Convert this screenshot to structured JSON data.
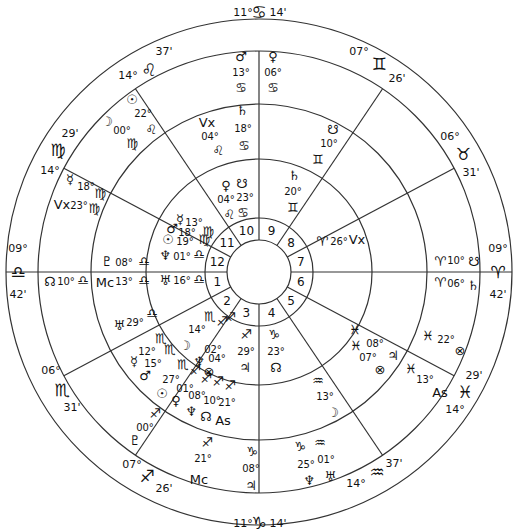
{
  "chart_title": "Bi-wheel natal chart (astrology)",
  "center": {
    "x": 259,
    "y": 272
  },
  "radii": {
    "outer": 253,
    "zodiac_inner": 221,
    "ring2": 168,
    "ring3": 113,
    "house_outer": 54,
    "inner": 32
  },
  "line_color": "#333333",
  "house_cusps": [
    {
      "id": "asc",
      "angle": 180,
      "degree": "09°",
      "sign_glyph": "♎",
      "minute": "42'",
      "sign": "Libra"
    },
    {
      "id": "c2",
      "angle": 208,
      "degree": "06°",
      "sign_glyph": "♏",
      "minute": "31'",
      "sign": "Scorpio"
    },
    {
      "id": "c3",
      "angle": 236,
      "degree": "07°",
      "sign_glyph": "♐",
      "minute": "26'",
      "sign": "Sagittarius"
    },
    {
      "id": "ic",
      "angle": 270,
      "degree": "11°",
      "sign_glyph": "♑",
      "minute": "14'",
      "sign": "Capricorn"
    },
    {
      "id": "c5",
      "angle": 304,
      "degree": "14°",
      "sign_glyph": "♒",
      "minute": "37'",
      "sign": "Aquarius"
    },
    {
      "id": "c6",
      "angle": 332,
      "degree": "14°",
      "sign_glyph": "♓",
      "minute": "29'",
      "sign": "Pisces"
    },
    {
      "id": "dsc",
      "angle": 0,
      "degree": "09°",
      "sign_glyph": "♈",
      "minute": "42'",
      "sign": "Aries"
    },
    {
      "id": "c8",
      "angle": 28,
      "degree": "06°",
      "sign_glyph": "♉",
      "minute": "31'",
      "sign": "Taurus"
    },
    {
      "id": "c9",
      "angle": 56,
      "degree": "07°",
      "sign_glyph": "♊",
      "minute": "26'",
      "sign": "Gemini"
    },
    {
      "id": "mc",
      "angle": 90,
      "degree": "11°",
      "sign_glyph": "♋",
      "minute": "14'",
      "sign": "Cancer"
    },
    {
      "id": "c11",
      "angle": 124,
      "degree": "14°",
      "sign_glyph": "♌",
      "minute": "37'",
      "sign": "Leo"
    },
    {
      "id": "c12",
      "angle": 152,
      "degree": "14°",
      "sign_glyph": "♍",
      "minute": "29'",
      "sign": "Virgo"
    }
  ],
  "house_numbers": [
    "1",
    "2",
    "3",
    "4",
    "5",
    "6",
    "7",
    "8",
    "9",
    "10",
    "11",
    "12"
  ],
  "outer_ring_placements": [
    {
      "label": "Mars",
      "glyph": "♂",
      "degree": "13°",
      "sign_glyph": "♋",
      "x": 241,
      "y": 60
    },
    {
      "label": "Venus",
      "glyph": "♀",
      "degree": "06°",
      "sign_glyph": "♋",
      "x": 271,
      "y": 60
    },
    {
      "label": "Sun",
      "glyph": "☉",
      "degree": "22°",
      "sign_glyph": "♌",
      "x": 133,
      "y": 100
    },
    {
      "label": "Moon",
      "glyph": "☽",
      "degree": "00°",
      "sign_glyph": "♍",
      "x": 106,
      "y": 122
    },
    {
      "label": "Mercury",
      "glyph": "☿",
      "degree": "18°",
      "sign_glyph": "♍",
      "x": 70,
      "y": 180
    },
    {
      "label": "Vertex",
      "glyph": "Vx",
      "degree": "23°",
      "sign_glyph": "♍",
      "x": 60,
      "y": 198
    },
    {
      "label": "Pluto",
      "glyph": "♇",
      "degree": "08°",
      "sign_glyph": "♎",
      "x": 110,
      "y": 262
    },
    {
      "label": "North Node",
      "glyph": "☊",
      "degree": "10°",
      "sign_glyph": "♎",
      "x": 50,
      "y": 282
    },
    {
      "label": "Midheaven",
      "glyph": "Mc",
      "degree": "13°",
      "sign_glyph": "♎",
      "x": 108,
      "y": 282
    },
    {
      "label": "Uranus",
      "glyph": "♅",
      "degree": "29°",
      "sign_glyph": "♎",
      "x": 120,
      "y": 326
    },
    {
      "label": "Mercury",
      "glyph": "☿",
      "degree": "12°",
      "sign_glyph": "♏",
      "x": 140,
      "y": 372
    },
    {
      "label": "Mars",
      "glyph": "♂",
      "degree": "15°",
      "sign_glyph": "♏",
      "x": 146,
      "y": 384
    },
    {
      "label": "Sun",
      "glyph": "☉",
      "degree": "27°",
      "sign_glyph": "♏",
      "x": 166,
      "y": 393
    },
    {
      "label": "Venus",
      "glyph": "♀",
      "degree": "01°",
      "sign_glyph": "♐",
      "x": 182,
      "y": 397
    },
    {
      "label": "Pluto",
      "glyph": "♇",
      "degree": "00°",
      "sign_glyph": "♐",
      "x": 140,
      "y": 420
    },
    {
      "label": "Midheaven",
      "glyph": "Mc",
      "degree": "21°",
      "sign_glyph": "♐",
      "x": 202,
      "y": 455
    },
    {
      "label": "Jupiter",
      "glyph": "♃",
      "degree": "08°",
      "sign_glyph": "♑",
      "x": 256,
      "y": 460
    },
    {
      "label": "Neptune",
      "glyph": "♆",
      "degree": "25°",
      "sign_glyph": "♑",
      "x": 310,
      "y": 465
    },
    {
      "label": "Uranus",
      "glyph": "♅",
      "degree": "01°",
      "sign_glyph": "♒",
      "x": 330,
      "y": 465
    },
    {
      "label": "Moon",
      "glyph": "☽",
      "degree": "13°",
      "sign_glyph": "♒",
      "x": 332,
      "y": 405
    },
    {
      "label": "Ascendant",
      "glyph": "As",
      "degree": "13°",
      "sign_glyph": "♓",
      "x": 440,
      "y": 390
    },
    {
      "label": "Part of Fortune",
      "glyph": "⊗",
      "degree": "22°",
      "sign_glyph": "♓",
      "x": 462,
      "y": 340
    },
    {
      "label": "Saturn",
      "glyph": "♄",
      "degree": "06°",
      "sign_glyph": "♈",
      "x": 466,
      "y": 283
    },
    {
      "label": "South Node",
      "glyph": "☋",
      "degree": "10°",
      "sign_glyph": "♈",
      "x": 466,
      "y": 262
    },
    {
      "label": "South Node",
      "glyph": "☋",
      "degree": "10°",
      "sign_glyph": "♊",
      "x": 335,
      "y": 133
    }
  ],
  "middle_ring_placements": [
    {
      "label": "Vertex",
      "glyph": "Vx",
      "degree": "04°",
      "sign_glyph": "♌"
    },
    {
      "label": "Saturn",
      "glyph": "♄",
      "degree": "18°",
      "sign_glyph": "♋"
    },
    {
      "label": "Neptune",
      "glyph": "♆",
      "degree": "01°",
      "sign_glyph": "♎"
    },
    {
      "label": "Uranus",
      "glyph": "♅",
      "degree": "16°",
      "sign_glyph": "♎"
    },
    {
      "label": "Moon",
      "glyph": "☽",
      "degree": "14°",
      "sign_glyph": "♏"
    },
    {
      "label": "Neptune",
      "glyph": "♆",
      "degree": "02°",
      "sign_glyph": "♐"
    },
    {
      "label": "Part of Fortune",
      "glyph": "⊗",
      "degree": "04°",
      "sign_glyph": "♐"
    },
    {
      "label": "Jupiter",
      "glyph": "♃",
      "degree": "29°",
      "sign_glyph": "♐"
    },
    {
      "label": "North Node",
      "glyph": "☊",
      "degree": "23°",
      "sign_glyph": "♑"
    },
    {
      "label": "Part of Fortune",
      "glyph": "⊗",
      "degree": "07°",
      "sign_glyph": "♓"
    },
    {
      "label": "Jupiter",
      "glyph": "♃",
      "degree": "08°",
      "sign_glyph": "♓"
    },
    {
      "label": "Vertex",
      "glyph": "Vx",
      "degree": "26°",
      "sign_glyph": "♈"
    },
    {
      "label": "Saturn",
      "glyph": "♄",
      "degree": "20°",
      "sign_glyph": "♊"
    },
    {
      "label": "Venus",
      "glyph": "♀",
      "degree": "04°",
      "sign_glyph": "♌"
    },
    {
      "label": "South Node",
      "glyph": "☋",
      "degree": "23°",
      "sign_glyph": "♋"
    },
    {
      "label": "Mercury",
      "glyph": "☿",
      "degree": "13°",
      "sign_glyph": "♍"
    },
    {
      "label": "Mars",
      "glyph": "♂",
      "degree": "18°",
      "sign_glyph": "♍"
    },
    {
      "label": "Sun",
      "glyph": "☉",
      "degree": "19°",
      "sign_glyph": "♍"
    },
    {
      "label": "Neptune",
      "glyph": "♆",
      "degree": "08°",
      "sign_glyph": "♐"
    },
    {
      "label": "North Node",
      "glyph": "☊",
      "degree": "10°",
      "sign_glyph": "♐"
    },
    {
      "label": "Ascendant",
      "glyph": "As",
      "degree": "21°",
      "sign_glyph": "♐"
    }
  ],
  "labels": [
    {
      "key": "mc_deg",
      "text": "11°",
      "x": 243,
      "y": 16
    },
    {
      "key": "mc_sign",
      "text": "♋",
      "x": 259,
      "y": 17
    },
    {
      "key": "mc_min",
      "text": "14'",
      "x": 277,
      "y": 16
    },
    {
      "key": "ic_deg",
      "text": "11°",
      "x": 243,
      "y": 528
    },
    {
      "key": "ic_sign",
      "text": "♑",
      "x": 259,
      "y": 529
    },
    {
      "key": "ic_min",
      "text": "14'",
      "x": 277,
      "y": 528
    },
    {
      "key": "asc_deg",
      "text": "09°",
      "x": 20,
      "y": 253
    },
    {
      "key": "asc_sign",
      "text": "♎",
      "x": 19,
      "y": 275
    },
    {
      "key": "asc_min",
      "text": "42'",
      "x": 20,
      "y": 297
    },
    {
      "key": "dsc_deg",
      "text": "09°",
      "x": 496,
      "y": 253
    },
    {
      "key": "dsc_sign",
      "text": "♈",
      "x": 497,
      "y": 275
    },
    {
      "key": "dsc_min",
      "text": "42'",
      "x": 496,
      "y": 297
    },
    {
      "key": "c11_min",
      "text": "37'",
      "x": 162,
      "y": 54
    },
    {
      "key": "c11_deg",
      "text": "14°",
      "x": 128,
      "y": 76
    },
    {
      "key": "c11_sign",
      "text": "♌",
      "x": 148,
      "y": 73
    },
    {
      "key": "c12_min",
      "text": "29'",
      "x": 70,
      "y": 135
    },
    {
      "key": "c12_sign",
      "text": "♍",
      "x": 59,
      "y": 152
    },
    {
      "key": "c12_deg",
      "text": "14°",
      "x": 51,
      "y": 172
    },
    {
      "key": "c9_deg",
      "text": "07°",
      "x": 358,
      "y": 52
    },
    {
      "key": "c9_sign",
      "text": "♊",
      "x": 378,
      "y": 67
    },
    {
      "key": "c9_min",
      "text": "26'",
      "x": 398,
      "y": 80
    },
    {
      "key": "c8_deg",
      "text": "06°",
      "x": 450,
      "y": 138
    },
    {
      "key": "c8_sign",
      "text": "♉",
      "x": 462,
      "y": 155
    },
    {
      "key": "c8_min",
      "text": "31'",
      "x": 470,
      "y": 172
    },
    {
      "key": "c2_deg",
      "text": "06°",
      "x": 50,
      "y": 373
    },
    {
      "key": "c2_sign",
      "text": "♏",
      "x": 62,
      "y": 392
    },
    {
      "key": "c2_min",
      "text": "31'",
      "x": 71,
      "y": 410
    },
    {
      "key": "c3_deg",
      "text": "07°",
      "x": 132,
      "y": 466
    },
    {
      "key": "c3_sign",
      "text": "♐",
      "x": 146,
      "y": 478
    },
    {
      "key": "c3_min",
      "text": "26'",
      "x": 164,
      "y": 490
    },
    {
      "key": "c5_deg",
      "text": "14°",
      "x": 354,
      "y": 486
    },
    {
      "key": "c5_sign",
      "text": "♒",
      "x": 376,
      "y": 474
    },
    {
      "key": "c5_min",
      "text": "37'",
      "x": 393,
      "y": 466
    },
    {
      "key": "c6_deg",
      "text": "14°",
      "x": 454,
      "y": 411
    },
    {
      "key": "c6_sign",
      "text": "♓",
      "x": 465,
      "y": 394
    },
    {
      "key": "c6_min",
      "text": "29'",
      "x": 474,
      "y": 377
    }
  ]
}
